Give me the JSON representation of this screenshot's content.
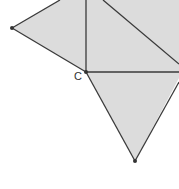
{
  "diagram": {
    "type": "geometry",
    "labels": {
      "C": "C"
    },
    "colors": {
      "fill": "#dcdcdc",
      "stroke": "#3a3a3a",
      "point": "#333333"
    },
    "points": {
      "left": [
        12,
        28
      ],
      "C": [
        86,
        72
      ],
      "bottom": [
        135,
        161
      ]
    }
  }
}
